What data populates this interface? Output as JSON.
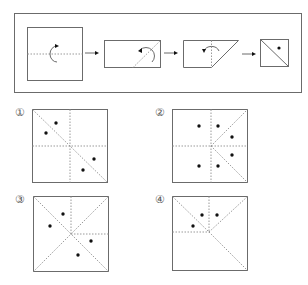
{
  "colors": {
    "line": "#6b6b6b",
    "fold": "#9a9a9a",
    "hole": "#111111",
    "background": "#ffffff"
  },
  "problem": {
    "steps": [
      {
        "id": 1,
        "shape": "square",
        "fold": "horizontal-center",
        "description": "Fold square in half bottom to top along horizontal center line"
      },
      {
        "id": 2,
        "shape": "rectangle",
        "fold": "diagonal",
        "description": "Fold rectangle along diagonal line"
      },
      {
        "id": 3,
        "shape": "trapezoid",
        "fold": "vertical",
        "description": "Fold trapezoid along vertical line"
      },
      {
        "id": 4,
        "shape": "square-with-diagonal",
        "punch": "one hole",
        "description": "Punch one hole"
      }
    ],
    "arrow_icon": "right-arrow"
  },
  "options": [
    {
      "label": "①",
      "id": 1,
      "holes": 4
    },
    {
      "label": "②",
      "id": 2,
      "holes": 6
    },
    {
      "label": "③",
      "id": 3,
      "holes": 4
    },
    {
      "label": "④",
      "id": 4,
      "holes": 3
    }
  ]
}
